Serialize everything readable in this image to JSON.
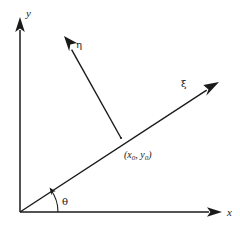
{
  "figure": {
    "background_color": "#ffffff",
    "stroke_color": "#1a1a1a"
  },
  "axes": {
    "x": {
      "label": "x",
      "icon": "arrow-right-icon",
      "origin": [
        20,
        212
      ],
      "tip": [
        222,
        212
      ]
    },
    "y": {
      "label": "y",
      "icon": "arrow-up-icon",
      "origin": [
        20,
        212
      ],
      "tip": [
        20,
        18
      ]
    }
  },
  "rotated_axes": {
    "xi": {
      "label": "ξ",
      "icon": "arrow-up-right-icon",
      "from": [
        20,
        212
      ],
      "tip": [
        219,
        82
      ],
      "label_pos": [
        183,
        84
      ]
    },
    "eta": {
      "label": "η",
      "icon": "arrow-up-left-icon",
      "from": [
        121,
        138
      ],
      "tip": [
        64,
        36
      ],
      "label_pos": [
        77,
        45
      ]
    }
  },
  "angle": {
    "label": "θ",
    "label_pos": [
      64,
      202
    ],
    "arc_center": [
      20,
      212
    ],
    "arc_radius": 38
  },
  "point": {
    "label_open": "(",
    "label_x": "x",
    "label_x_sub": "0",
    "label_comma": ", ",
    "label_y": "y",
    "label_y_sub": "0",
    "label_close": ")",
    "label_full": "(x0, y0)",
    "position": [
      121,
      138
    ],
    "label_pos": [
      126,
      156
    ]
  }
}
